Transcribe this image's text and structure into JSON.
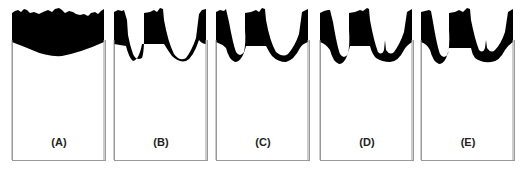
{
  "figure": {
    "panels": [
      {
        "id": "A",
        "label": "(A)",
        "left": 12
      },
      {
        "id": "B",
        "label": "(B)",
        "left": 114
      },
      {
        "id": "C",
        "label": "(C)",
        "left": 216
      },
      {
        "id": "D",
        "label": "(D)",
        "left": 320
      },
      {
        "id": "E",
        "label": "(E)",
        "left": 421
      }
    ],
    "colors": {
      "fill": "#000000",
      "border": "#9a9a9a",
      "background": "#ffffff",
      "label": "#222222"
    }
  }
}
